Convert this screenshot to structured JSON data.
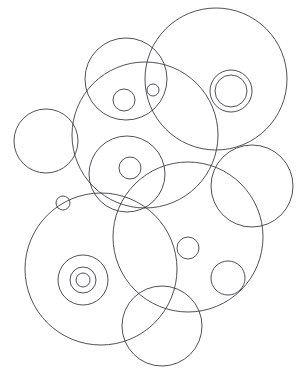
{
  "canvas": {
    "width": 301,
    "height": 373,
    "background_color": "#ffffff",
    "stroke_color": "#3c3c46",
    "stroke_width": 0.9,
    "title": "overlapping-circles-line-drawing"
  },
  "figure": {
    "name": "overlapping-circles",
    "circle_count": 18,
    "circles": [
      {
        "name": "top-right-large-circle",
        "cx": 216,
        "cy": 79,
        "r": 71
      },
      {
        "name": "top-right-ring-outer",
        "cx": 231,
        "cy": 91,
        "r": 21
      },
      {
        "name": "top-right-ring-inner",
        "cx": 231,
        "cy": 91,
        "r": 16
      },
      {
        "name": "top-middle-circle",
        "cx": 126,
        "cy": 79,
        "r": 41
      },
      {
        "name": "top-middle-inner-circle",
        "cx": 124,
        "cy": 100,
        "r": 11
      },
      {
        "name": "top-middle-tiny-circle",
        "cx": 153,
        "cy": 90,
        "r": 6
      },
      {
        "name": "upper-middle-large-circle",
        "cx": 145,
        "cy": 135,
        "r": 73
      },
      {
        "name": "left-circle",
        "cx": 46,
        "cy": 141,
        "r": 32
      },
      {
        "name": "center-medium-circle",
        "cx": 127,
        "cy": 174,
        "r": 38
      },
      {
        "name": "center-inner-circle",
        "cx": 130,
        "cy": 168,
        "r": 11
      },
      {
        "name": "right-middle-circle",
        "cx": 252,
        "cy": 186,
        "r": 41
      },
      {
        "name": "left-tiny-circle",
        "cx": 63,
        "cy": 203,
        "r": 7
      },
      {
        "name": "bottom-left-large-circle",
        "cx": 101,
        "cy": 269,
        "r": 76
      },
      {
        "name": "bottom-left-ring-outer",
        "cx": 83,
        "cy": 280,
        "r": 25
      },
      {
        "name": "bottom-left-ring-middle",
        "cx": 83,
        "cy": 280,
        "r": 13
      },
      {
        "name": "bottom-left-ring-inner",
        "cx": 83,
        "cy": 280,
        "r": 7
      },
      {
        "name": "bottom-right-large-circle",
        "cx": 188,
        "cy": 237,
        "r": 75
      },
      {
        "name": "bottom-right-small-circle",
        "cx": 188,
        "cy": 248,
        "r": 11
      },
      {
        "name": "bottom-right-medium-circle",
        "cx": 228,
        "cy": 278,
        "r": 17
      },
      {
        "name": "bottom-middle-circle",
        "cx": 162,
        "cy": 326,
        "r": 40
      }
    ]
  }
}
